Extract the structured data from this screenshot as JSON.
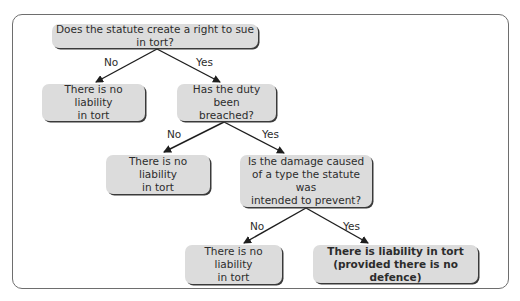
{
  "diagram": {
    "type": "decision-tree",
    "nodes": {
      "q1": "Does the statute create a right to sue in tort?",
      "q1_no": "There is no liability\nin tort",
      "q2": "Has the duty been\nbreached?",
      "q2_no": "There is no liability\nin tort",
      "q3": "Is the damage caused\nof a type the statute was\nintended to prevent?",
      "q3_no": "There is no liability\nin tort",
      "q3_yes": "There is liability in tort\n(provided there is no defence)"
    },
    "edges": [
      {
        "from": "q1",
        "to": "q1_no",
        "label": "No"
      },
      {
        "from": "q1",
        "to": "q2",
        "label": "Yes"
      },
      {
        "from": "q2",
        "to": "q2_no",
        "label": "No"
      },
      {
        "from": "q2",
        "to": "q3",
        "label": "Yes"
      },
      {
        "from": "q3",
        "to": "q3_no",
        "label": "No"
      },
      {
        "from": "q3",
        "to": "q3_yes",
        "label": "Yes"
      }
    ],
    "colors": {
      "node_fill": "#dcdcdc",
      "node_shadow": "#3a3a3a",
      "frame": "#6e6e6e",
      "arrow": "#1e1e1e"
    }
  }
}
